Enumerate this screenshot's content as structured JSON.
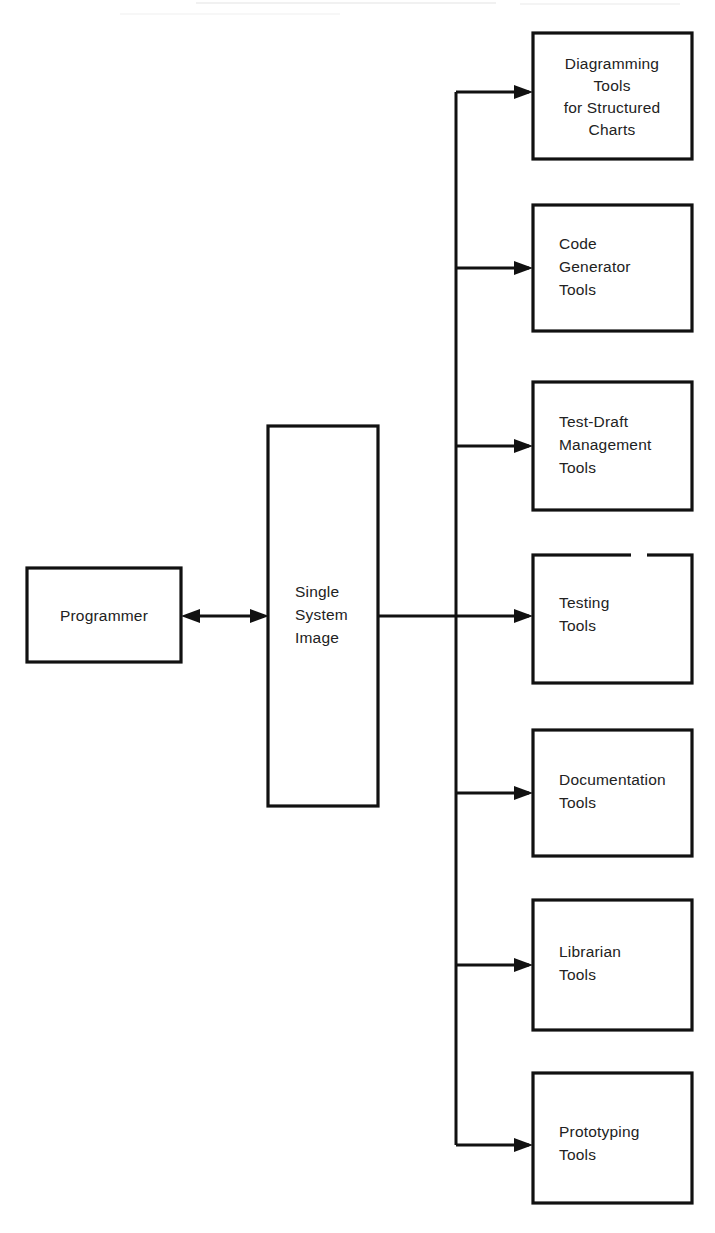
{
  "diagram": {
    "type": "block-flow-diagram",
    "actor": {
      "label": "Programmer",
      "shape": "rectangle"
    },
    "hub": {
      "line1": "Single",
      "line2": "System",
      "line3": "Image",
      "shape": "tall-rectangle"
    },
    "connection": {
      "actor_to_hub": "bidirectional-arrow",
      "hub_to_tools": "bus-branching-arrows"
    },
    "tools": [
      {
        "name": "diagramming-tools",
        "lines": [
          "Diagramming",
          "Tools",
          "for  Structured",
          "Charts"
        ],
        "align": "center"
      },
      {
        "name": "code-generator-tools",
        "lines": [
          "Code",
          "Generator",
          "Tools"
        ],
        "align": "left"
      },
      {
        "name": "test-draft-management-tools",
        "lines": [
          "Test-Draft",
          "Management",
          "Tools"
        ],
        "align": "left"
      },
      {
        "name": "testing-tools",
        "lines": [
          "Testing",
          "Tools"
        ],
        "align": "left"
      },
      {
        "name": "documentation-tools",
        "lines": [
          "Documentation",
          "Tools"
        ],
        "align": "left"
      },
      {
        "name": "librarian-tools",
        "lines": [
          "Librarian",
          "Tools"
        ],
        "align": "left"
      },
      {
        "name": "prototyping-tools",
        "lines": [
          "Prototyping",
          "Tools"
        ],
        "align": "left"
      }
    ],
    "colors": {
      "stroke": "#111111",
      "fill": "#ffffff",
      "text": "#222222"
    }
  }
}
